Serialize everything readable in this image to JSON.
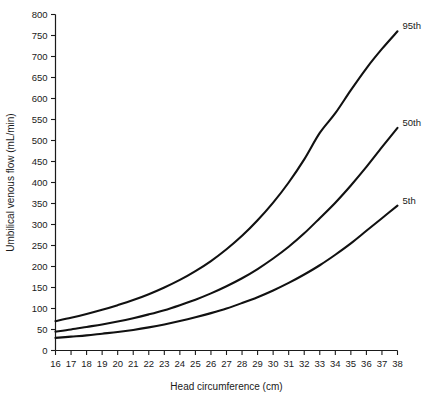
{
  "chart_data": {
    "type": "line",
    "title": "",
    "subtitle": "",
    "xlabel": "Head circumference (cm)",
    "ylabel": "Umbilical venous flow (mL/min)",
    "xlim": [
      16,
      38
    ],
    "ylim": [
      0,
      800
    ],
    "grid": false,
    "legend_position": "inline-right-end",
    "xticks": [
      16,
      17,
      18,
      19,
      20,
      21,
      22,
      23,
      24,
      25,
      26,
      27,
      28,
      29,
      30,
      31,
      32,
      33,
      34,
      35,
      36,
      37,
      38
    ],
    "xtick_labels": [
      "16",
      "17",
      "18",
      "19",
      "20",
      "21",
      "22",
      "23",
      "24",
      "25",
      "26",
      "27",
      "28",
      "29",
      "30",
      "31",
      "32",
      "33",
      "34",
      "35",
      "36",
      "37",
      "38"
    ],
    "yticks": [
      0,
      50,
      100,
      150,
      200,
      250,
      300,
      350,
      400,
      450,
      500,
      550,
      600,
      650,
      700,
      750,
      800
    ],
    "ytick_labels": [
      "0",
      "50",
      "100",
      "150",
      "200",
      "250",
      "300",
      "350",
      "400",
      "450",
      "500",
      "550",
      "600",
      "650",
      "700",
      "750",
      "800"
    ],
    "x": [
      16,
      17,
      18,
      19,
      20,
      21,
      22,
      23,
      24,
      25,
      26,
      27,
      28,
      29,
      30,
      31,
      32,
      33,
      34,
      35,
      36,
      37,
      38
    ],
    "series": [
      {
        "name": "95th",
        "label": "95th",
        "color": "#111111",
        "values": [
          70,
          78,
          87,
          97,
          108,
          120,
          134,
          150,
          168,
          189,
          213,
          241,
          273,
          310,
          352,
          400,
          455,
          518,
          565,
          620,
          672,
          718,
          760
        ]
      },
      {
        "name": "50th",
        "label": "50th",
        "color": "#111111",
        "values": [
          45,
          50,
          56,
          62,
          69,
          77,
          86,
          96,
          108,
          121,
          136,
          153,
          172,
          194,
          219,
          247,
          279,
          315,
          352,
          393,
          437,
          484,
          530
        ]
      },
      {
        "name": "5th",
        "label": "5th",
        "color": "#111111",
        "values": [
          30,
          33,
          36,
          40,
          44,
          49,
          55,
          62,
          70,
          79,
          89,
          100,
          113,
          127,
          143,
          161,
          181,
          203,
          228,
          255,
          285,
          315,
          345
        ]
      }
    ]
  },
  "axes": {
    "x_axis_title": "Head circumference (cm)",
    "y_axis_title": "Umbilical venous flow (mL/min)"
  },
  "labels": {
    "p95": "95th",
    "p50": "50th",
    "p5": "5th"
  }
}
